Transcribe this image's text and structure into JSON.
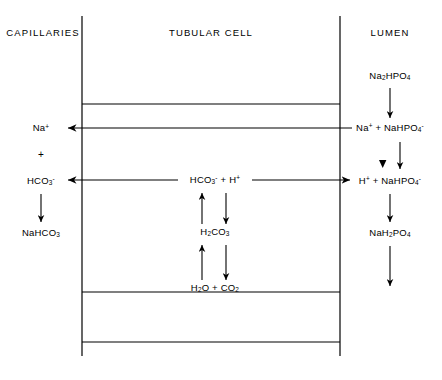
{
  "figure": {
    "headers": [
      {
        "id": "capillaries",
        "text": "CAPILLARIES",
        "x": 43,
        "y": 33
      },
      {
        "id": "tubular-cell",
        "text": "TUBULAR CELL",
        "x": 211,
        "y": 33
      },
      {
        "id": "lumen",
        "text": "LUMEN",
        "x": 390,
        "y": 33
      }
    ],
    "capillary_column": [
      {
        "id": "sodium-ion",
        "html": "Na<sup>+</sup>",
        "x": 41,
        "y": 128
      },
      {
        "id": "plus-sign",
        "html": "+",
        "x": 41,
        "y": 155
      },
      {
        "id": "bicarbonate-ion",
        "html": "HCO<sub>3</sub><sup>-</sup>",
        "x": 41,
        "y": 181
      },
      {
        "id": "sodium-bicarbonate",
        "html": "NaHCO<sub>3</sub>",
        "x": 41,
        "y": 233
      }
    ],
    "cell_column": [
      {
        "id": "bicarbonate-plus-proton",
        "html": "HCO<sub>3</sub><sup>-</sup> + H<sup>+</sup>",
        "x": 215,
        "y": 180
      },
      {
        "id": "carbonic-acid",
        "html": "H<sub>2</sub>CO<sub>3</sub>",
        "x": 215,
        "y": 232
      },
      {
        "id": "water-plus-carbon-dioxide",
        "html": "H<sub>2</sub>O + CO<sub>2</sub>",
        "x": 215,
        "y": 288
      }
    ],
    "lumen_column": [
      {
        "id": "disodium-phosphate",
        "html": "Na<sub>2</sub>HPO<sub>4</sub>",
        "x": 390,
        "y": 76
      },
      {
        "id": "sodium-plus-monosodium-phosphate",
        "html": "Na<sup>+</sup> + NaHPO<sub>4</sub><sup>-</sup>",
        "x": 390,
        "y": 128
      },
      {
        "id": "proton-plus-monosodium-phosphate",
        "html": "H<sup>+</sup> + NaHPO<sub>4</sub><sup>-</sup>",
        "x": 390,
        "y": 181
      },
      {
        "id": "monosodium-dihydrogen-phosphate",
        "html": "NaH<sub>2</sub>PO<sub>4</sub>",
        "x": 390,
        "y": 233
      }
    ],
    "membranes": {
      "basolateral_x": 82,
      "apical_x": 340,
      "vertical_top": 16,
      "vertical_bottom": 356,
      "horizontal_lines": [
        104,
        292,
        342
      ]
    },
    "transport_arrows": [
      {
        "id": "sodium-reabsorption-arrow",
        "direction": "left"
      },
      {
        "id": "bicarbonate-reabsorption-arrow",
        "direction": "left"
      },
      {
        "id": "proton-secretion-arrow",
        "direction": "right"
      }
    ],
    "colors": {
      "ink": "#000000",
      "background": "#ffffff"
    }
  }
}
